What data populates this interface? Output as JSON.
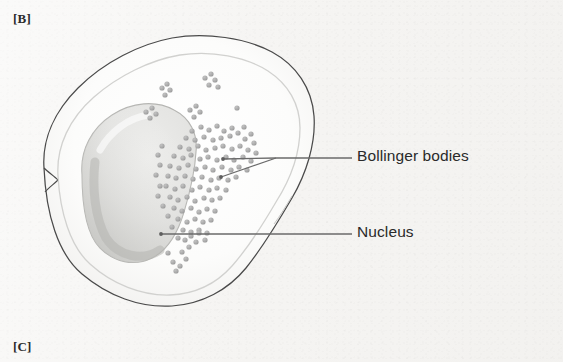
{
  "figure": {
    "panel_tags": [
      {
        "name": "panel-tag-b",
        "text": "[B]"
      },
      {
        "name": "panel-tag-c",
        "text": "[C]"
      }
    ],
    "callouts": [
      {
        "name": "bollinger-bodies",
        "label": "Bollinger bodies"
      },
      {
        "name": "nucleus",
        "label": "Nucleus"
      }
    ],
    "structures": [
      {
        "name": "cell-membrane",
        "label": "cell outline"
      },
      {
        "name": "cytoplasm",
        "label": "cytoplasm"
      },
      {
        "name": "nucleus-body",
        "label": "nucleus"
      },
      {
        "name": "granule-cluster",
        "label": "Bollinger bodies granules"
      }
    ]
  },
  "colors": {
    "background": "#f5f4f2",
    "outline": "#4a4a4a",
    "cytoplasm_fill": "#fbfbfa",
    "nucleus_fill": "#e3e3e1",
    "nucleus_shade": "#c9c9c7",
    "granule": "#aaaaaa",
    "leader_line": "#6a6a6a",
    "text": "#2a2a2a"
  },
  "granules": {
    "scatter": [
      [
        162,
        88
      ],
      [
        167,
        84
      ],
      [
        170,
        90
      ],
      [
        165,
        95
      ],
      [
        205,
        78
      ],
      [
        211,
        74
      ],
      [
        215,
        80
      ],
      [
        209,
        85
      ],
      [
        218,
        87
      ],
      [
        146,
        112
      ],
      [
        152,
        108
      ],
      [
        156,
        114
      ],
      [
        150,
        118
      ],
      [
        190,
        110
      ],
      [
        196,
        106
      ],
      [
        200,
        112
      ],
      [
        194,
        117
      ],
      [
        237,
        108
      ],
      [
        185,
        240
      ],
      [
        191,
        236
      ],
      [
        196,
        242
      ],
      [
        189,
        247
      ],
      [
        199,
        233
      ],
      [
        173,
        262
      ],
      [
        180,
        266
      ],
      [
        176,
        271
      ],
      [
        186,
        259
      ]
    ],
    "cluster_center": [
      205,
      170
    ],
    "cluster_count": 118
  },
  "leaders": {
    "bollinger": {
      "text_start": [
        352,
        158
      ],
      "fork": [
        276,
        158
      ],
      "tip_a": [
        223,
        159
      ],
      "tip_b": [
        221,
        177
      ]
    },
    "nucleus": {
      "text_start": [
        352,
        234
      ],
      "tip": [
        161,
        234
      ]
    }
  }
}
